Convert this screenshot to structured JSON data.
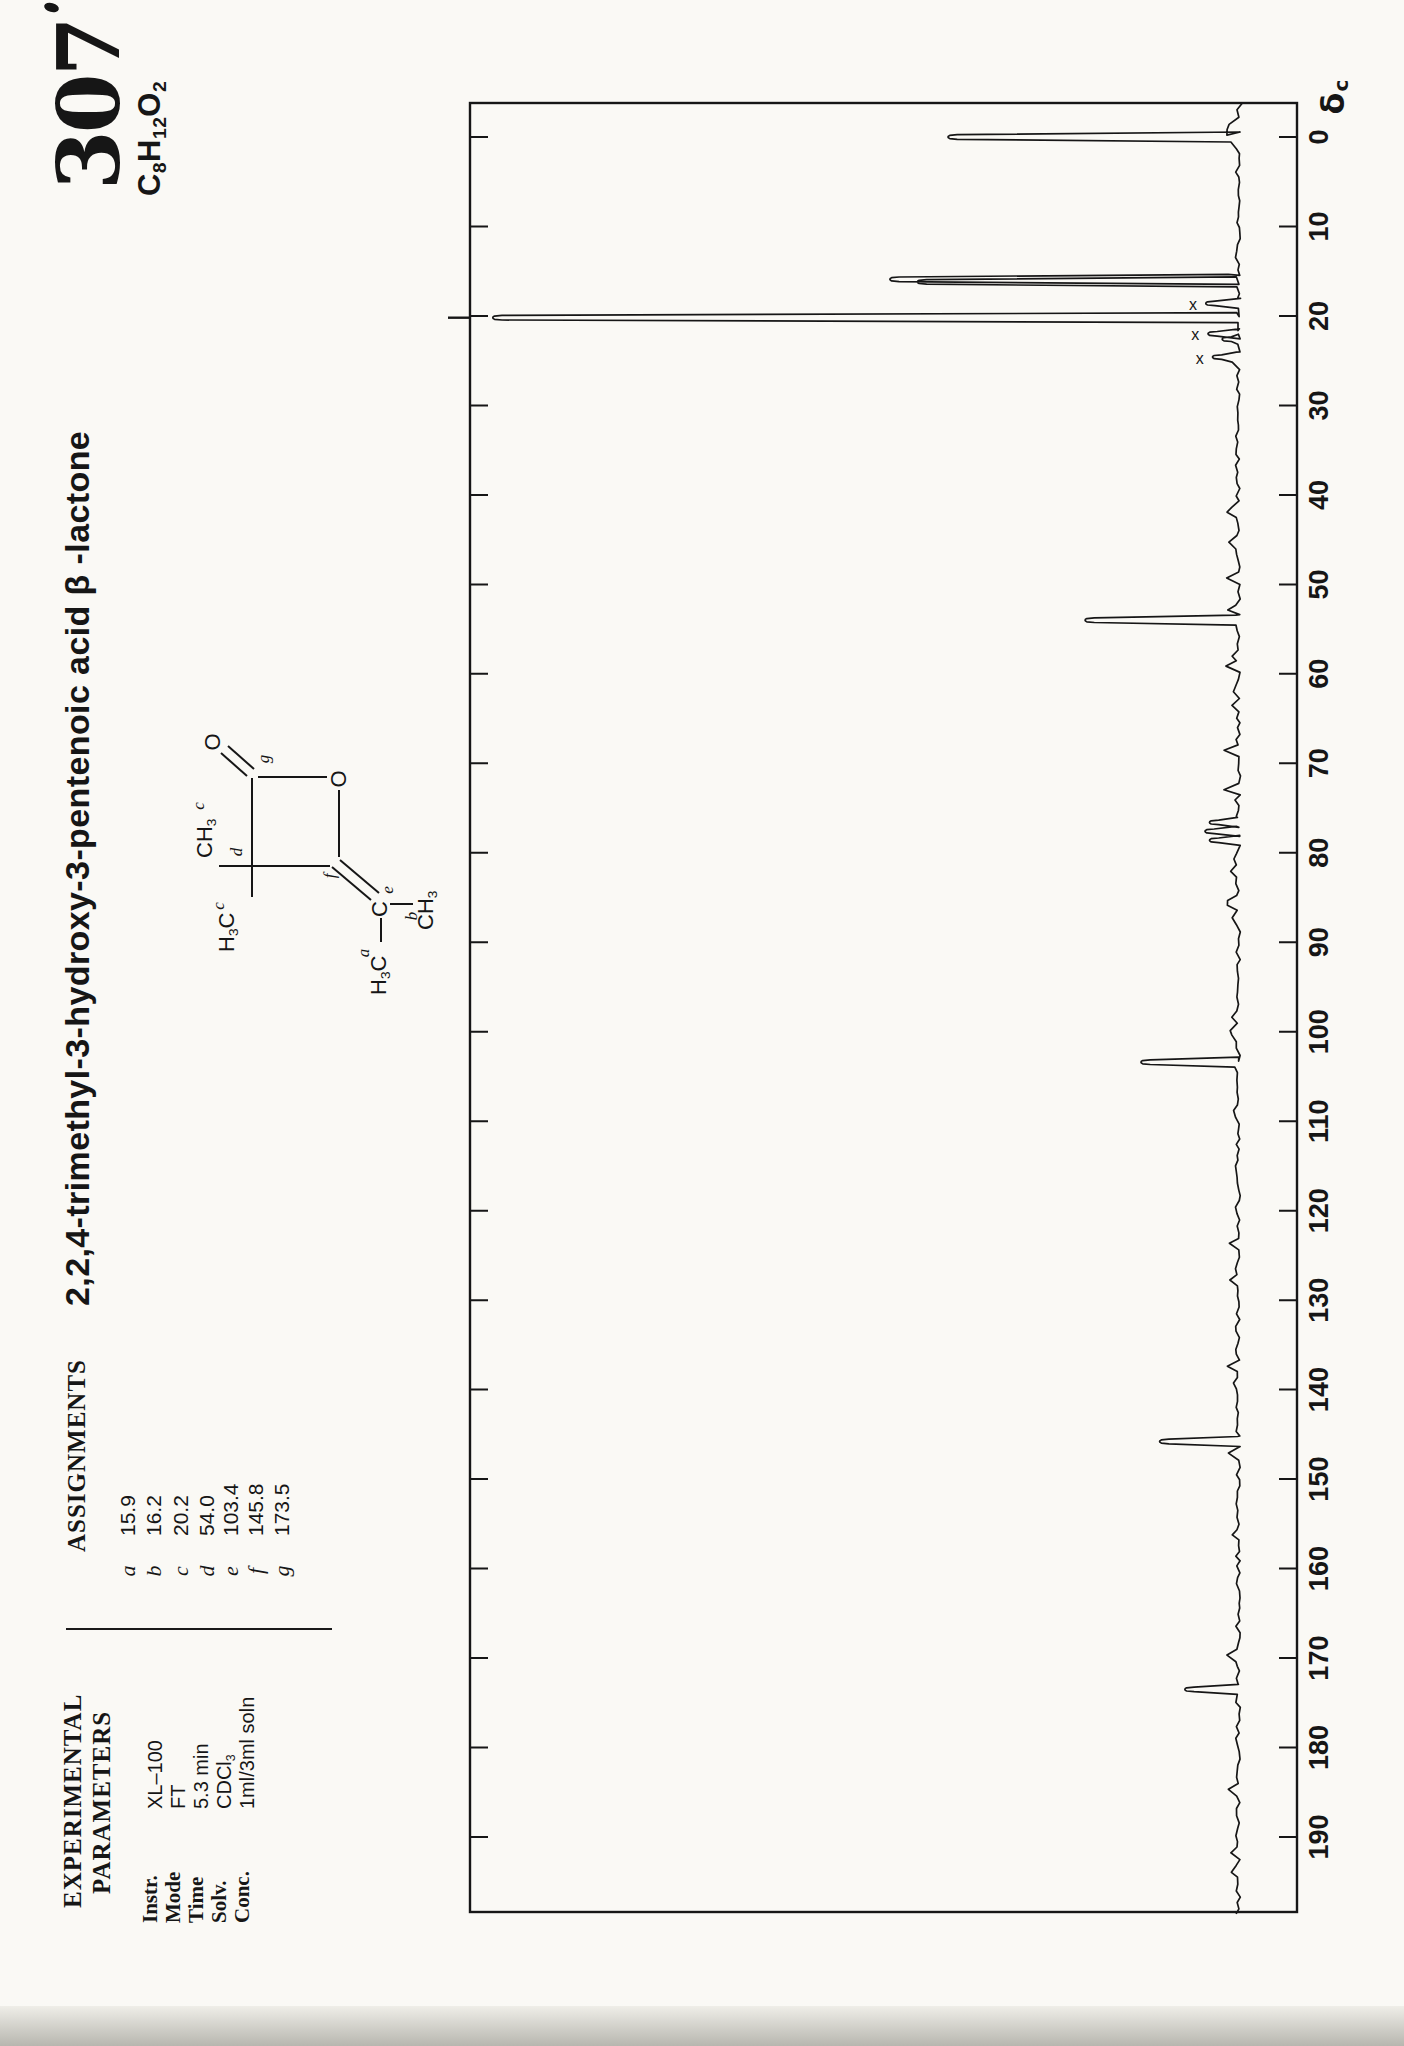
{
  "page": {
    "catalog_number": "307",
    "formula": [
      {
        "t": "C"
      },
      {
        "t": "8",
        "sub": true
      },
      {
        "t": "H"
      },
      {
        "t": "12",
        "sub": true
      },
      {
        "t": "O"
      },
      {
        "t": "2",
        "sub": true
      }
    ],
    "title": "2,2,4-trimethyl-3-hydroxy-3-pentenoic acid β -lactone"
  },
  "assignments": {
    "heading": "ASSIGNMENTS",
    "items": [
      {
        "label": "a",
        "value": "15.9"
      },
      {
        "label": "b",
        "value": "16.2"
      },
      {
        "label": "c",
        "value": "20.2"
      },
      {
        "label": "d",
        "value": "54.0"
      },
      {
        "label": "e",
        "value": "103.4"
      },
      {
        "label": "f",
        "value": "145.8"
      },
      {
        "label": "g",
        "value": "173.5"
      }
    ]
  },
  "experimental": {
    "heading": [
      "EXPERIMENTAL",
      "PARAMETERS"
    ],
    "items": [
      {
        "label": "Instr.",
        "value": [
          {
            "t": "XL–100"
          }
        ]
      },
      {
        "label": "Mode",
        "value": [
          {
            "t": "FT"
          }
        ]
      },
      {
        "label": "Time",
        "value": [
          {
            "t": "5.3 min"
          }
        ]
      },
      {
        "label": "Solv.",
        "value": [
          {
            "t": "CDCl"
          },
          {
            "t": "3",
            "sub": true
          }
        ]
      },
      {
        "label": "Conc.",
        "value": [
          {
            "t": "1ml/3ml soln"
          }
        ]
      }
    ]
  },
  "structure": {
    "atom_labels": {
      "carbonyl_o": "O",
      "ring_o": "O",
      "ene_c": "C",
      "methyl_top": [
        {
          "t": "CH"
        },
        {
          "t": "3",
          "sub": true
        }
      ],
      "methyl_left": [
        {
          "t": "H"
        },
        {
          "t": "3",
          "sub": true
        },
        {
          "t": "C"
        }
      ],
      "methyl_a": [
        {
          "t": "H"
        },
        {
          "t": "3",
          "sub": true
        },
        {
          "t": "C"
        }
      ],
      "methyl_b": [
        {
          "t": "CH"
        },
        {
          "t": "3",
          "sub": true
        }
      ]
    },
    "position_labels": {
      "g": "g",
      "d": "d",
      "f": "f",
      "e": "e",
      "a": "a",
      "b": "b",
      "c_top": "c",
      "c_left": "c"
    }
  },
  "chart_data": {
    "type": "line",
    "orientation": "rotated-90ccw",
    "axis": {
      "label_main": "δ",
      "label_sub": "c",
      "min": 0,
      "max": 190,
      "tick_step": 10,
      "labels": [
        0,
        10,
        20,
        30,
        40,
        50,
        60,
        70,
        80,
        90,
        100,
        110,
        120,
        130,
        140,
        150,
        160,
        170,
        180,
        190
      ]
    },
    "impurity_marker_glyph": "x",
    "peaks": [
      {
        "ppm": 0.0,
        "intensity": 0.389,
        "note": "TMS reference"
      },
      {
        "ppm": 15.9,
        "intensity": 0.467,
        "assignment": "a"
      },
      {
        "ppm": 16.2,
        "intensity": 0.43,
        "assignment": "b"
      },
      {
        "ppm": 18.6,
        "intensity": 0.043,
        "mark": "x"
      },
      {
        "ppm": 20.2,
        "intensity": 1.0,
        "assignment": "c",
        "clipped": true
      },
      {
        "ppm": 22.0,
        "intensity": 0.04,
        "mark": "x"
      },
      {
        "ppm": 22.6,
        "intensity": 0.021
      },
      {
        "ppm": 24.6,
        "intensity": 0.034,
        "mark": "x"
      },
      {
        "ppm": 54.0,
        "intensity": 0.205,
        "assignment": "d"
      },
      {
        "ppm": 76.6,
        "intensity": 0.038,
        "note": "CDCl3"
      },
      {
        "ppm": 77.6,
        "intensity": 0.044,
        "note": "CDCl3"
      },
      {
        "ppm": 78.6,
        "intensity": 0.038,
        "note": "CDCl3"
      },
      {
        "ppm": 103.4,
        "intensity": 0.13,
        "assignment": "e"
      },
      {
        "ppm": 145.8,
        "intensity": 0.105,
        "assignment": "f"
      },
      {
        "ppm": 173.5,
        "intensity": 0.071,
        "assignment": "g"
      }
    ]
  }
}
